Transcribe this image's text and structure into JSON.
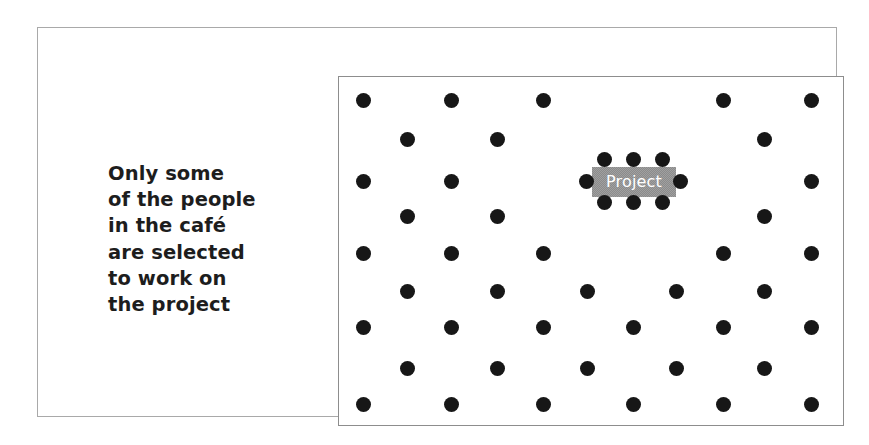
{
  "figure": {
    "caption": "Only some\nof the people\nin the café\nare selected\nto work on\nthe project",
    "project_label": "Project",
    "colors": {
      "dot": "#171717",
      "label_background": "#8b8b8b",
      "label_text": "#ffffff",
      "inner_border": "#8d8d8d",
      "outer_border": "#a9a9a9",
      "page_background": "#ffffff",
      "caption_text": "#1d1d1d"
    }
  },
  "chart_data": {
    "type": "scatter",
    "title": "",
    "xlabel": "",
    "ylabel": "",
    "grid": false,
    "legend": "none",
    "xlim": [
      0,
      506
    ],
    "ylim": [
      0,
      350
    ],
    "series": [
      {
        "name": "people",
        "marker": "filled-circle",
        "color": "#171717",
        "radius": 7.5,
        "count": 45,
        "points": [
          {
            "x": 24,
            "y": 23
          },
          {
            "x": 112,
            "y": 23
          },
          {
            "x": 204,
            "y": 23
          },
          {
            "x": 384,
            "y": 23
          },
          {
            "x": 472,
            "y": 23
          },
          {
            "x": 68,
            "y": 62
          },
          {
            "x": 158,
            "y": 62
          },
          {
            "x": 425,
            "y": 62
          },
          {
            "x": 24,
            "y": 104
          },
          {
            "x": 112,
            "y": 104
          },
          {
            "x": 472,
            "y": 104
          },
          {
            "x": 68,
            "y": 139
          },
          {
            "x": 158,
            "y": 139
          },
          {
            "x": 425,
            "y": 139
          },
          {
            "x": 24,
            "y": 176
          },
          {
            "x": 112,
            "y": 176
          },
          {
            "x": 204,
            "y": 176
          },
          {
            "x": 384,
            "y": 176
          },
          {
            "x": 472,
            "y": 176
          },
          {
            "x": 68,
            "y": 214
          },
          {
            "x": 158,
            "y": 214
          },
          {
            "x": 248,
            "y": 214
          },
          {
            "x": 337,
            "y": 214
          },
          {
            "x": 425,
            "y": 214
          },
          {
            "x": 24,
            "y": 250
          },
          {
            "x": 112,
            "y": 250
          },
          {
            "x": 204,
            "y": 250
          },
          {
            "x": 294,
            "y": 250
          },
          {
            "x": 384,
            "y": 250
          },
          {
            "x": 472,
            "y": 250
          },
          {
            "x": 68,
            "y": 291
          },
          {
            "x": 158,
            "y": 291
          },
          {
            "x": 248,
            "y": 291
          },
          {
            "x": 337,
            "y": 291
          },
          {
            "x": 425,
            "y": 291
          },
          {
            "x": 24,
            "y": 327
          },
          {
            "x": 112,
            "y": 327
          },
          {
            "x": 204,
            "y": 327
          },
          {
            "x": 294,
            "y": 327
          },
          {
            "x": 384,
            "y": 327
          },
          {
            "x": 472,
            "y": 327
          }
        ]
      },
      {
        "name": "project-team",
        "marker": "filled-circle",
        "color": "#171717",
        "radius": 7.5,
        "count": 8,
        "points": [
          {
            "x": 265,
            "y": 82
          },
          {
            "x": 294,
            "y": 82
          },
          {
            "x": 323,
            "y": 82
          },
          {
            "x": 247,
            "y": 104
          },
          {
            "x": 341,
            "y": 104
          },
          {
            "x": 265,
            "y": 125
          },
          {
            "x": 294,
            "y": 125
          },
          {
            "x": 323,
            "y": 125
          }
        ]
      }
    ],
    "annotations": [
      {
        "text": "Project",
        "x": 253,
        "y": 90,
        "width": 84,
        "height": 30,
        "background": "#8b8b8b",
        "color": "#ffffff"
      }
    ]
  }
}
